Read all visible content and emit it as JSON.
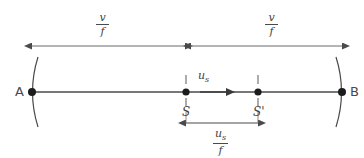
{
  "diagram": {
    "background_color": "#ffffff",
    "stroke_color": "#4a4a4a",
    "text_color": "#3f3f3f",
    "width": 364,
    "height": 158,
    "endpoints": {
      "left_label": "A",
      "right_label": "B"
    },
    "source_points": {
      "initial_label": "S",
      "moved_label": "S'"
    },
    "velocity": {
      "symbol": "u",
      "subscript": "s",
      "label": "us"
    },
    "measures": [
      {
        "name": "left-wavelength",
        "numerator": "v",
        "numerator_sub": "",
        "denominator": "f",
        "label": "v/f",
        "span_from": "A",
        "span_to": "S"
      },
      {
        "name": "right-wavelength",
        "numerator": "v",
        "numerator_sub": "",
        "denominator": "f",
        "label": "v/f",
        "span_from": "S",
        "span_to": "B"
      },
      {
        "name": "source-displacement",
        "numerator": "u",
        "numerator_sub": "s",
        "denominator": "f",
        "label": "us/f",
        "span_from": "S",
        "span_to": "S'"
      }
    ]
  }
}
